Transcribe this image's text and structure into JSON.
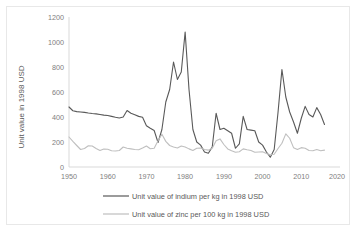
{
  "chart_data": {
    "type": "line",
    "title": "",
    "xlabel": "",
    "ylabel": "Unit value in 1998 USD",
    "xlim": [
      1950,
      2020
    ],
    "ylim": [
      0,
      1200
    ],
    "xticks": [
      1950,
      1960,
      1970,
      1980,
      1990,
      2000,
      2010,
      2020
    ],
    "yticks": [
      0,
      200,
      400,
      600,
      800,
      1000,
      1200
    ],
    "grid": false,
    "legend_position": "bottom",
    "x": [
      1950,
      1951,
      1952,
      1953,
      1954,
      1955,
      1956,
      1957,
      1958,
      1959,
      1960,
      1961,
      1962,
      1963,
      1964,
      1965,
      1966,
      1967,
      1968,
      1969,
      1970,
      1971,
      1972,
      1973,
      1974,
      1975,
      1976,
      1977,
      1978,
      1979,
      1980,
      1981,
      1982,
      1983,
      1984,
      1985,
      1986,
      1987,
      1988,
      1989,
      1990,
      1991,
      1992,
      1993,
      1994,
      1995,
      1996,
      1997,
      1998,
      1999,
      2000,
      2001,
      2002,
      2003,
      2004,
      2005,
      2006,
      2007,
      2008,
      2009,
      2010,
      2011,
      2012,
      2013,
      2014,
      2015,
      2016
    ],
    "series": [
      {
        "name": "Unit value of indium per kg in 1998 USD",
        "color": "#595959",
        "values": [
          480,
          450,
          443,
          440,
          437,
          432,
          428,
          425,
          420,
          415,
          412,
          405,
          398,
          392,
          400,
          452,
          430,
          418,
          405,
          398,
          330,
          310,
          292,
          196,
          300,
          520,
          620,
          840,
          700,
          760,
          1080,
          620,
          300,
          200,
          175,
          120,
          110,
          160,
          430,
          300,
          310,
          290,
          270,
          150,
          185,
          405,
          300,
          295,
          290,
          200,
          175,
          120,
          78,
          140,
          440,
          780,
          560,
          440,
          360,
          270,
          390,
          485,
          420,
          400,
          475,
          420,
          340
        ]
      },
      {
        "name": "Unit value of zinc per 100 kg in 1998 USD",
        "color": "#bfbfbf",
        "values": [
          240,
          205,
          172,
          140,
          148,
          170,
          168,
          148,
          132,
          144,
          142,
          130,
          128,
          132,
          160,
          150,
          145,
          140,
          138,
          152,
          168,
          146,
          150,
          210,
          262,
          205,
          172,
          160,
          152,
          168,
          160,
          145,
          132,
          150,
          152,
          140,
          135,
          150,
          210,
          225,
          180,
          145,
          130,
          118,
          122,
          145,
          138,
          132,
          118,
          120,
          122,
          108,
          98,
          102,
          148,
          190,
          265,
          230,
          155,
          140,
          155,
          150,
          132,
          130,
          140,
          130,
          135
        ]
      }
    ]
  },
  "axis": {
    "y_title": "Unit value in 1998 USD",
    "y_tick_labels": [
      "1200",
      "1000",
      "800",
      "600",
      "400",
      "200",
      "0"
    ],
    "x_tick_labels": [
      "1950",
      "1960",
      "1970",
      "1980",
      "1990",
      "2000",
      "2010",
      "2020"
    ]
  },
  "legend": {
    "items": [
      {
        "label": "Unit value of indium per kg in 1998 USD",
        "color": "#595959"
      },
      {
        "label": "Unit value of zinc per 100 kg in 1998 USD",
        "color": "#bfbfbf"
      }
    ]
  }
}
